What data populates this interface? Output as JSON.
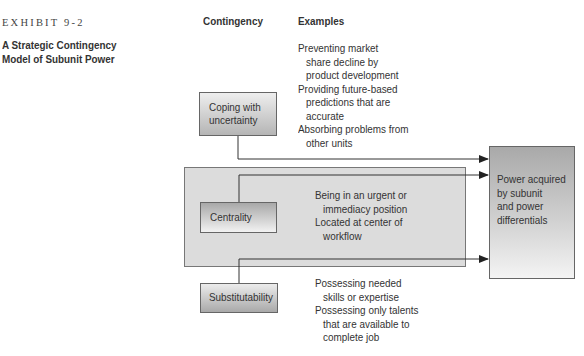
{
  "exhibit": {
    "label": "EXHIBIT 9-2",
    "title_line1": "A Strategic Contingency",
    "title_line2": "Model of Subunit Power"
  },
  "columns": {
    "contingency": "Contingency",
    "examples": "Examples"
  },
  "contingencies": [
    {
      "label_lines": [
        "Coping with",
        "uncertainty"
      ],
      "examples": [
        {
          "text": "Preventing market",
          "indent": false
        },
        {
          "text": "share decline by",
          "indent": true
        },
        {
          "text": "product development",
          "indent": true
        },
        {
          "text": "Providing future-based",
          "indent": false
        },
        {
          "text": "predictions that are",
          "indent": true
        },
        {
          "text": "accurate",
          "indent": true
        },
        {
          "text": "Absorbing problems from",
          "indent": false
        },
        {
          "text": "other units",
          "indent": true
        }
      ]
    },
    {
      "label_lines": [
        "Centrality"
      ],
      "examples": [
        {
          "text": "Being in an urgent or",
          "indent": false
        },
        {
          "text": "immediacy position",
          "indent": true
        },
        {
          "text": "Located at center of",
          "indent": false
        },
        {
          "text": "workflow",
          "indent": true
        }
      ]
    },
    {
      "label_lines": [
        "Substitutability"
      ],
      "examples": [
        {
          "text": "Possessing needed",
          "indent": false
        },
        {
          "text": "skills or expertise",
          "indent": true
        },
        {
          "text": "Possessing only talents",
          "indent": false
        },
        {
          "text": "that are available to",
          "indent": true
        },
        {
          "text": "complete job",
          "indent": true
        }
      ]
    }
  ],
  "outcome": {
    "label_lines": [
      "Power acquired",
      "by subunit",
      "and power",
      "differentials"
    ]
  },
  "colors": {
    "panel": "#dcdcdc",
    "line": "#333333",
    "text": "#333333"
  }
}
